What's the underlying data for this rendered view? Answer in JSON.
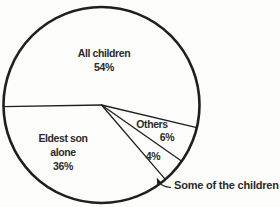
{
  "figure": {
    "background": "#fdfdfb",
    "line_color": "#1f1f1f",
    "text_color": "#2b2b2b"
  },
  "chart_data": {
    "type": "pie",
    "title": "",
    "legend": "none",
    "fill": "none",
    "start_angle_deg": 181,
    "direction": "clockwise",
    "total": 100,
    "slices": [
      {
        "label": "All children",
        "value": 54,
        "pct_label": "54%",
        "display_lines": [
          "All children",
          "54%"
        ]
      },
      {
        "label": "Others",
        "value": 6,
        "pct_label": "6%"
      },
      {
        "label": "Some of the children",
        "value": 4,
        "pct_label": "4%",
        "callout": "Some of the children"
      },
      {
        "label": "Eldest son alone",
        "value": 36,
        "pct_label": "36%",
        "display_lines": [
          "Eldest son",
          "alone",
          "36%"
        ]
      }
    ]
  }
}
